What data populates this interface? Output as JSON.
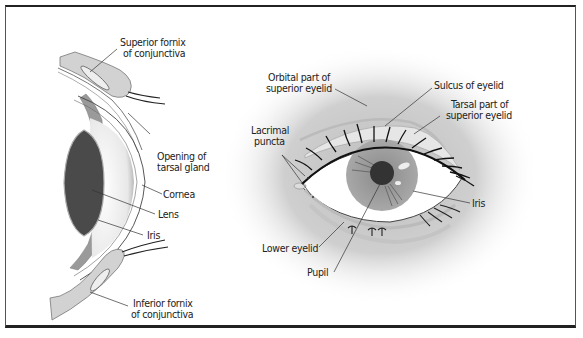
{
  "figure": {
    "panels": [
      {
        "name": "sagittal-section",
        "labels": {
          "superior_fornix": [
            "Superior fornix",
            "of conjunctiva"
          ],
          "opening_tarsal": [
            "Opening of",
            "tarsal gland"
          ],
          "cornea": "Cornea",
          "lens": "Lens",
          "iris": "Iris",
          "inferior_fornix": [
            "Inferior fornix",
            "of conjunctiva"
          ]
        }
      },
      {
        "name": "frontal-view",
        "labels": {
          "orbital_part": [
            "Orbital part of",
            "superior eyelid"
          ],
          "sulcus": "Sulcus of eyelid",
          "tarsal_part": [
            "Tarsal part of",
            "superior eyelid"
          ],
          "lacrimal_puncta": [
            "Lacrimal",
            "puncta"
          ],
          "iris": "Iris",
          "lower_eyelid": "Lower eyelid",
          "pupil": "Pupil"
        }
      }
    ],
    "colors": {
      "border": "#222222",
      "lid_fill": "#d4d4d4",
      "lens_fill": "#4a4a4a",
      "iris_fill": "#9a9a9a",
      "pupil_fill": "#333333",
      "shadow": "#c8c8c8"
    }
  }
}
